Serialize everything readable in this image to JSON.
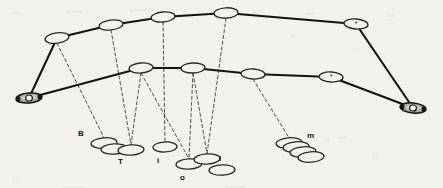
{
  "figure": {
    "kind": "scanned-line-diagram",
    "canvas": {
      "width": 443,
      "height": 188
    },
    "colors": {
      "background": "#f4f2ef",
      "ink": "#1b1915",
      "solid_link": "#141210",
      "dashed_link": "#33302b",
      "ellipse_stroke": "#2b2823",
      "label_text": "#17150f",
      "endpoint_fill": "#8d8a83"
    }
  },
  "nodes": {
    "upper_chain": [
      {
        "id": "u1",
        "cx": 57,
        "cy": 38,
        "rx": 12,
        "ry": 5.2,
        "rot": -8,
        "mark": ""
      },
      {
        "id": "u2",
        "cx": 111,
        "cy": 25,
        "rx": 12,
        "ry": 5.0,
        "rot": -7,
        "mark": ""
      },
      {
        "id": "u3",
        "cx": 163,
        "cy": 17,
        "rx": 12,
        "ry": 5.0,
        "rot": -5,
        "mark": ""
      },
      {
        "id": "u4",
        "cx": 226,
        "cy": 13,
        "rx": 12,
        "ry": 5.2,
        "rot": -3,
        "mark": ""
      },
      {
        "id": "u5",
        "cx": 356,
        "cy": 24,
        "rx": 12,
        "ry": 5.0,
        "rot": 4,
        "mark": "*"
      }
    ],
    "lower_chain": [
      {
        "id": "l1",
        "cx": 141,
        "cy": 68,
        "rx": 12,
        "ry": 5.0,
        "rot": -4,
        "mark": ""
      },
      {
        "id": "l2",
        "cx": 193,
        "cy": 68,
        "rx": 12,
        "ry": 5.0,
        "rot": -2,
        "mark": ""
      },
      {
        "id": "l3",
        "cx": 253,
        "cy": 74,
        "rx": 12,
        "ry": 5.0,
        "rot": 3,
        "mark": ""
      },
      {
        "id": "l4",
        "cx": 331,
        "cy": 77,
        "rx": 12,
        "ry": 5.0,
        "rot": 3,
        "mark": "*"
      }
    ],
    "endpoints": [
      {
        "id": "e_left",
        "cx": 29,
        "cy": 98,
        "rx": 13,
        "ry": 5.0,
        "rot": -5,
        "label": "endpoint-left"
      },
      {
        "id": "e_right",
        "cx": 413,
        "cy": 108,
        "rx": 13,
        "ry": 5.0,
        "rot": 6,
        "label": "endpoint-right"
      }
    ]
  },
  "solid_links": [
    {
      "from": "u1",
      "to": "u2"
    },
    {
      "from": "u2",
      "to": "u3"
    },
    {
      "from": "u3",
      "to": "u4"
    },
    {
      "from": "u4",
      "to": "u5"
    },
    {
      "from": "u1",
      "to": "e_left"
    },
    {
      "from": "u5",
      "to": "e_right"
    },
    {
      "from": "e_left",
      "to": "l1"
    },
    {
      "from": "l1",
      "to": "l2"
    },
    {
      "from": "l2",
      "to": "l3"
    },
    {
      "from": "l3",
      "to": "l4"
    },
    {
      "from": "l4",
      "to": "e_right"
    }
  ],
  "dashed_links": [
    {
      "from": "u1",
      "to": "cluster_B"
    },
    {
      "from": "u2",
      "to": "cluster_T"
    },
    {
      "from": "u3",
      "to": "cluster_i"
    },
    {
      "from": "u4",
      "to": "cluster_l"
    },
    {
      "from": "l1",
      "to": "cluster_T"
    },
    {
      "from": "l1",
      "to": "cluster_o"
    },
    {
      "from": "l2",
      "to": "cluster_o"
    },
    {
      "from": "l2",
      "to": "cluster_l"
    },
    {
      "from": "l3",
      "to": "cluster_m"
    }
  ],
  "clusters": [
    {
      "id": "cluster_B",
      "label": "B",
      "label_x": 78,
      "label_y": 130,
      "ellipses": [
        {
          "cx": 104,
          "cy": 143,
          "rx": 13,
          "ry": 5.2,
          "rot": -4
        },
        {
          "cx": 114,
          "cy": 149,
          "rx": 13,
          "ry": 5.2,
          "rot": -3
        }
      ]
    },
    {
      "id": "cluster_T",
      "label": "T",
      "label_x": 118,
      "label_y": 158,
      "ellipses": [
        {
          "cx": 131,
          "cy": 150,
          "rx": 13,
          "ry": 5.2,
          "rot": -3
        }
      ]
    },
    {
      "id": "cluster_i",
      "label": "i",
      "label_x": 157,
      "label_y": 157,
      "ellipses": [
        {
          "cx": 165,
          "cy": 147,
          "rx": 12,
          "ry": 5.0,
          "rot": -2
        }
      ]
    },
    {
      "id": "cluster_o",
      "label": "o",
      "label_x": 180,
      "label_y": 174,
      "ellipses": [
        {
          "cx": 189,
          "cy": 164,
          "rx": 13,
          "ry": 5.2,
          "rot": -3
        }
      ]
    },
    {
      "id": "cluster_l",
      "label": "l",
      "label_x": 219,
      "label_y": 155,
      "ellipses": [
        {
          "cx": 207,
          "cy": 159,
          "rx": 13,
          "ry": 5.2,
          "rot": -3
        },
        {
          "cx": 222,
          "cy": 170,
          "rx": 13,
          "ry": 5.2,
          "rot": -2
        }
      ]
    },
    {
      "id": "cluster_m",
      "label": "m",
      "label_x": 307,
      "label_y": 132,
      "ellipses": [
        {
          "cx": 289,
          "cy": 143,
          "rx": 13,
          "ry": 5.2,
          "rot": -4
        },
        {
          "cx": 296,
          "cy": 147,
          "rx": 13,
          "ry": 5.2,
          "rot": -4
        },
        {
          "cx": 303,
          "cy": 152,
          "rx": 13,
          "ry": 5.2,
          "rot": -4
        },
        {
          "cx": 311,
          "cy": 157,
          "rx": 13,
          "ry": 5.2,
          "rot": -4
        }
      ]
    }
  ],
  "ghost_text": [
    {
      "text": "the",
      "x": 12,
      "y": 8,
      "size": 7
    },
    {
      "text": "rather",
      "x": 66,
      "y": 6,
      "size": 7
    },
    {
      "text": "possible",
      "x": 130,
      "y": 5,
      "size": 7
    },
    {
      "text": "a",
      "x": 212,
      "y": 7,
      "size": 7
    },
    {
      "text": "and",
      "x": 252,
      "y": 6,
      "size": 7
    },
    {
      "text": "are",
      "x": 306,
      "y": 8,
      "size": 7
    },
    {
      "text": "out",
      "x": 386,
      "y": 10,
      "size": 7
    },
    {
      "text": "in",
      "x": 290,
      "y": 30,
      "size": 7
    },
    {
      "text": "for",
      "x": 352,
      "y": 44,
      "size": 7
    },
    {
      "text": "19",
      "x": 322,
      "y": 136,
      "size": 7
    },
    {
      "text": "the",
      "x": 338,
      "y": 132,
      "size": 7
    },
    {
      "text": "41",
      "x": 372,
      "y": 150,
      "size": 7
    },
    {
      "text": "to",
      "x": 12,
      "y": 176,
      "size": 7
    },
    {
      "text": "number",
      "x": 62,
      "y": 182,
      "size": 7
    },
    {
      "text": "system",
      "x": 226,
      "y": 182,
      "size": 7
    }
  ]
}
